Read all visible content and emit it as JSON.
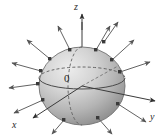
{
  "figure": {
    "name": "sphere-with-outward-normal-vectors",
    "caption_text": "",
    "background_color": "#ffffff",
    "axes": {
      "z": {
        "label": "z",
        "direction": "up"
      },
      "y": {
        "label": "y",
        "direction": "right"
      },
      "x": {
        "label": "x",
        "direction": "down-left"
      }
    },
    "origin": {
      "label": "0"
    },
    "sphere": {
      "center": {
        "x": 82,
        "y": 86
      },
      "radius_x": 43,
      "radius_y": 39,
      "fill_light": "#e8e8e8",
      "fill_mid": "#bfbfbf",
      "fill_dark": "#8e8e8e",
      "outline_color": "#6f6f6f"
    },
    "equator": {
      "style_front": "solid",
      "style_back": "dashed",
      "color": "#5c5c5c"
    },
    "meridian": {
      "style_front": "solid",
      "style_back": "dashed",
      "color": "#5c5c5c"
    },
    "normal_vectors": {
      "count": 12,
      "color": "#6a6a6a",
      "base_marker": "square-dot",
      "base_marker_color": "#3a3a3a",
      "description": "outward unit normal vectors on sphere surface"
    },
    "colors": {
      "line": "#4a4a4a",
      "axis": "#3b3b3b",
      "text": "#1f1f1f"
    }
  }
}
